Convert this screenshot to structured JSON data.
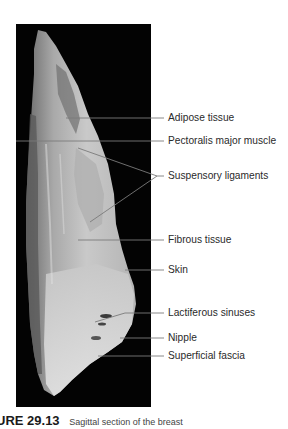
{
  "figure": {
    "photo_alt": "Sagittal section of breast specimen on black background",
    "background_color": "#030303",
    "labels": [
      {
        "id": "adipose",
        "text": "Adipose tissue",
        "y": 118
      },
      {
        "id": "pectoralis",
        "text": "Pectoralis major muscle",
        "y": 141
      },
      {
        "id": "suspensory",
        "text": "Suspensory ligaments",
        "y": 176
      },
      {
        "id": "fibrous",
        "text": "Fibrous tissue",
        "y": 240
      },
      {
        "id": "skin",
        "text": "Skin",
        "y": 270
      },
      {
        "id": "lactiferous",
        "text": "Lactiferous sinuses",
        "y": 313
      },
      {
        "id": "nipple",
        "text": "Nipple",
        "y": 338
      },
      {
        "id": "fascia",
        "text": "Superficial fascia",
        "y": 356
      }
    ]
  },
  "caption": {
    "figure_number": "URE 29.13",
    "description": "Sagittal section of the breast"
  }
}
